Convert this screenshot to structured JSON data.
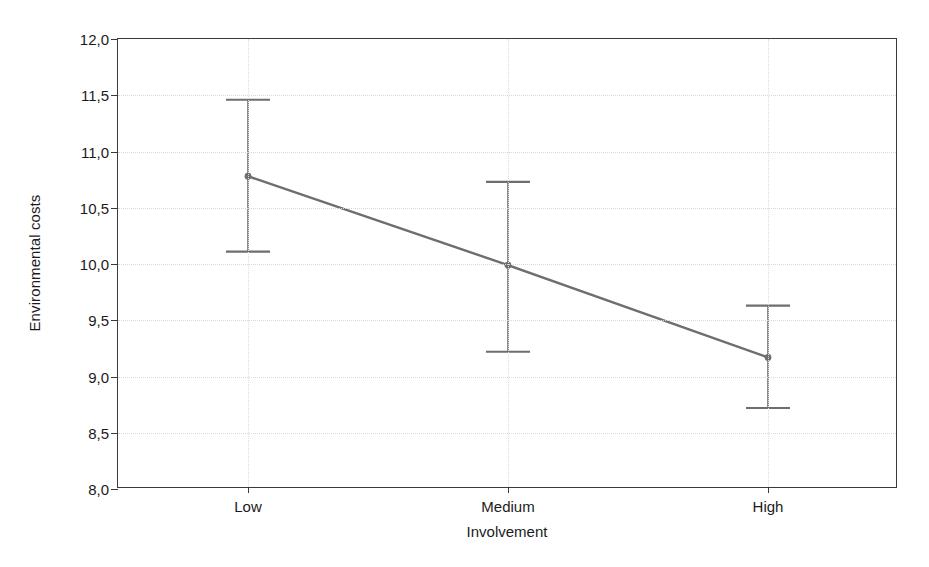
{
  "chart_data": {
    "type": "line",
    "title": "",
    "subtitle": "",
    "xlabel": "Involvement",
    "ylabel": "Environmental costs",
    "categories": [
      "Low",
      "Medium",
      "High"
    ],
    "series": [
      {
        "name": "Environmental costs",
        "values": [
          10.78,
          9.99,
          9.17
        ],
        "error_lower": [
          10.11,
          9.22,
          8.72
        ],
        "error_upper": [
          11.46,
          10.73,
          9.63
        ],
        "color": "#6e6e6e",
        "marker": "circle"
      }
    ],
    "ylim": [
      8.0,
      12.0
    ],
    "ytick_labels": [
      "12,0",
      "11,5",
      "11,0",
      "10,5",
      "10,0",
      "9,5",
      "9,0",
      "8,5",
      "8,0"
    ],
    "ytick_values": [
      12.0,
      11.5,
      11.0,
      10.5,
      10.0,
      9.5,
      9.0,
      8.5,
      8.0
    ],
    "grid": true,
    "grid_axes": "both",
    "legend": "none",
    "error_bar_style": "capped-whisker",
    "axis_color": "#3a3a3a",
    "grid_color": "#d9d9d9",
    "background_color": "#ffffff"
  }
}
